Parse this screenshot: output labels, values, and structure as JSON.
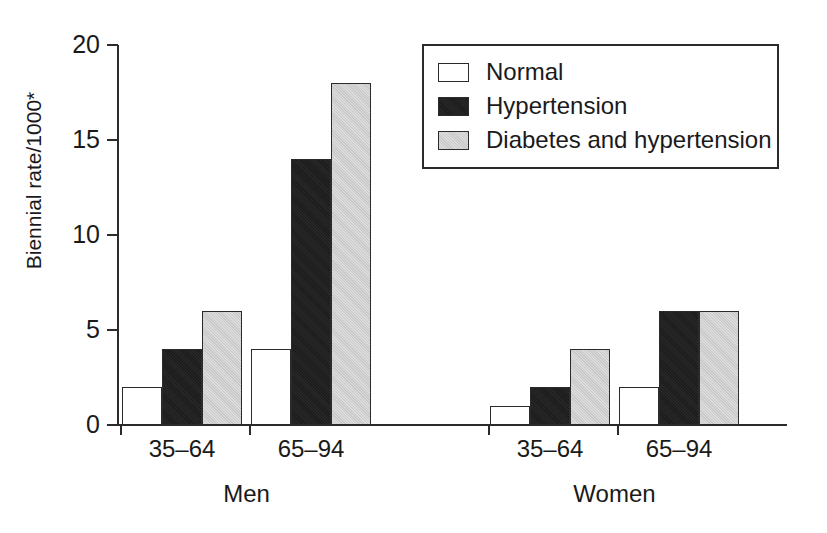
{
  "chart_data": {
    "type": "bar",
    "title": "",
    "subtitle": "",
    "xlabel": "",
    "ylabel": "Biennial rate/1000*",
    "ylim": [
      0,
      20
    ],
    "yticks": [
      0,
      5,
      10,
      15,
      20
    ],
    "ytick_labels": [
      "0",
      "5",
      "10",
      "15",
      "20"
    ],
    "grid": false,
    "legend_position": "top-right",
    "legend_entries": [
      "Normal",
      "Hypertension",
      "Diabetes and hypertension"
    ],
    "group_labels": [
      "Men",
      "Women"
    ],
    "categories": [
      "35–64",
      "65–94",
      "35–64",
      "65–94"
    ],
    "groups": [
      {
        "name": "Men",
        "categories": [
          "35–64",
          "65–94"
        ],
        "bars": [
          {
            "category": "35–64",
            "series": "Normal",
            "value": 2
          },
          {
            "category": "35–64",
            "series": "Hypertension",
            "value": 4
          },
          {
            "category": "35–64",
            "series": "Diabetes and hypertension",
            "value": 6
          },
          {
            "category": "65–94",
            "series": "Normal",
            "value": 4
          },
          {
            "category": "65–94",
            "series": "Hypertension",
            "value": 14
          },
          {
            "category": "65–94",
            "series": "Diabetes and hypertension",
            "value": 18
          }
        ]
      },
      {
        "name": "Women",
        "categories": [
          "35–64",
          "65–94"
        ],
        "bars": [
          {
            "category": "35–64",
            "series": "Normal",
            "value": 1
          },
          {
            "category": "35–64",
            "series": "Hypertension",
            "value": 2
          },
          {
            "category": "35–64",
            "series": "Diabetes and hypertension",
            "value": 4
          },
          {
            "category": "65–94",
            "series": "Normal",
            "value": 2
          },
          {
            "category": "65–94",
            "series": "Hypertension",
            "value": 6
          },
          {
            "category": "65–94",
            "series": "Diabetes and hypertension",
            "value": 6
          }
        ]
      }
    ],
    "series": [
      {
        "name": "Normal",
        "color": "#ffffff",
        "values": [
          2,
          4,
          1,
          2
        ]
      },
      {
        "name": "Hypertension",
        "color": "#1c1c1c",
        "values": [
          4,
          14,
          2,
          6
        ]
      },
      {
        "name": "Diabetes and hypertension",
        "color": "#c9c9c9",
        "values": [
          6,
          18,
          4,
          6
        ]
      }
    ],
    "colors": {
      "normal": "#ffffff",
      "hypertension": "#1c1c1c",
      "diabetes": "#c9c9c9",
      "axis": "#2b2b2b",
      "text": "#1a1a1a",
      "background": "#ffffff"
    }
  }
}
